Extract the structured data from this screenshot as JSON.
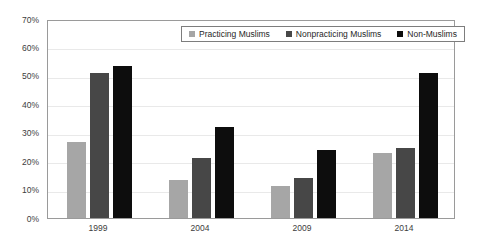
{
  "chart_data": {
    "type": "bar",
    "title": "",
    "xlabel": "",
    "ylabel": "",
    "categories": [
      "1999",
      "2004",
      "2009",
      "2014"
    ],
    "series": [
      {
        "name": "Practicing Muslims",
        "color": "#a6a6a6",
        "values": [
          26.7,
          13.3,
          11.3,
          22.7
        ]
      },
      {
        "name": "Nonpracticing Muslims",
        "color": "#474747",
        "values": [
          51.0,
          21.0,
          14.2,
          24.7
        ]
      },
      {
        "name": "Non-Muslims",
        "color": "#0d0d0d",
        "values": [
          53.5,
          32.0,
          24.0,
          51.0
        ]
      }
    ],
    "ylim": [
      0,
      70
    ],
    "y_ticks": [
      0,
      10,
      20,
      30,
      40,
      50,
      60,
      70
    ],
    "y_tick_labels": [
      "0%",
      "10%",
      "20%",
      "30%",
      "40%",
      "50%",
      "60%",
      "70%"
    ],
    "grid": true,
    "legend_position": "top-right-inside"
  },
  "legend": {
    "items": [
      {
        "label": "Practicing Muslims",
        "color": "#a6a6a6"
      },
      {
        "label": "Nonpracticing Muslims",
        "color": "#474747"
      },
      {
        "label": "Non-Muslims",
        "color": "#0d0d0d"
      }
    ]
  },
  "style": {
    "plot_border": "#9a9a9a",
    "gridline": "#e9e9e9",
    "tick_text": "#3d3d3d",
    "background": "#ffffff"
  }
}
